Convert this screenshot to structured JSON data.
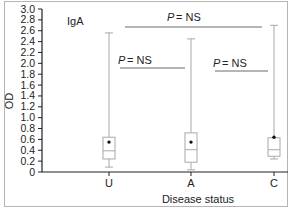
{
  "chart_data": {
    "type": "box",
    "title": "IgA",
    "xlabel": "Disease status",
    "ylabel": "OD",
    "ylim": [
      0,
      3.0
    ],
    "yticks": [
      "0",
      "0.2",
      "0.4",
      "0.6",
      "0.8",
      "1.0",
      "1.2",
      "1.4",
      "1.6",
      "1.8",
      "2.0",
      "2.2",
      "2.4",
      "2.6",
      "2.8",
      "3.0"
    ],
    "categories": [
      "U",
      "A",
      "C"
    ],
    "series": [
      {
        "name": "U",
        "min": 0.09,
        "q1": 0.24,
        "median": 0.39,
        "q3": 0.64,
        "max": 2.56,
        "mean": 0.55
      },
      {
        "name": "A",
        "min": 0.04,
        "q1": 0.18,
        "median": 0.41,
        "q3": 0.72,
        "max": 2.45,
        "mean": 0.55
      },
      {
        "name": "C",
        "min": 0.24,
        "q1": 0.29,
        "median": 0.41,
        "q3": 0.63,
        "max": 2.7,
        "mean": 0.64
      }
    ],
    "annotations": [
      {
        "text": "P = NS",
        "from": "U",
        "to": "C",
        "level": "top"
      },
      {
        "text": "P = NS",
        "from": "U",
        "to": "A",
        "level": "lower"
      },
      {
        "text": "P = NS",
        "from": "A",
        "to": "C",
        "level": "lower"
      }
    ],
    "grid": false,
    "legend": "none"
  },
  "labels": {
    "panel": "IgA",
    "x_axis": "Disease status",
    "y_axis": "OD",
    "p_top": "= NS",
    "p_left": "= NS",
    "p_right": "= NS",
    "p_symbol": "P",
    "cat_u": "U",
    "cat_a": "A",
    "cat_c": "C"
  }
}
